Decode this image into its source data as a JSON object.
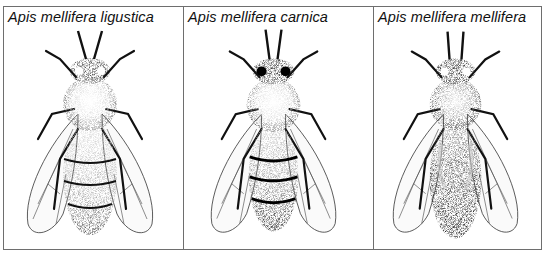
{
  "figure": {
    "panels": [
      {
        "id": "ligustica",
        "label": "Apis mellifera ligustica",
        "abdomen_shade": "#555555",
        "thorax_shade": "#dcdcdc"
      },
      {
        "id": "carnica",
        "label": "Apis mellifera carnica",
        "abdomen_shade": "#3a3a3a",
        "thorax_shade": "#d6d6d6"
      },
      {
        "id": "mellifera",
        "label": "Apis mellifera mellifera",
        "abdomen_shade": "#1e1e1e",
        "thorax_shade": "#a8a8a8"
      }
    ]
  }
}
